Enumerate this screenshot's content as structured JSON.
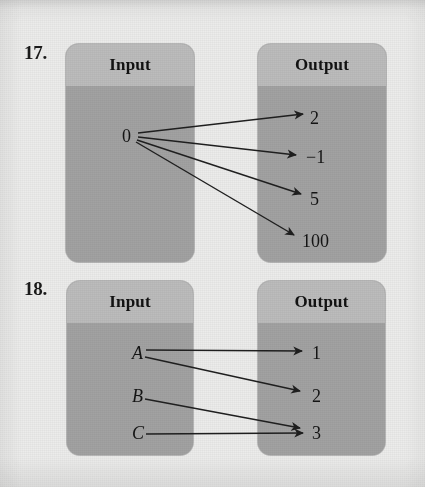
{
  "page": {
    "background_color": "#ececeb",
    "box_header_color": "#bcbcbc",
    "box_body_color": "#a2a2a2",
    "ink_color": "#1a1a1a"
  },
  "problems": [
    {
      "number": "17.",
      "input_box": {
        "title": "Input"
      },
      "output_box": {
        "title": "Output"
      },
      "inputs": [
        {
          "label": "0"
        }
      ],
      "outputs": [
        {
          "label": "2"
        },
        {
          "label": "−1"
        },
        {
          "label": "5"
        },
        {
          "label": "100"
        }
      ],
      "mappings": [
        {
          "from": "0",
          "to": "2"
        },
        {
          "from": "0",
          "to": "−1"
        },
        {
          "from": "0",
          "to": "5"
        },
        {
          "from": "0",
          "to": "100"
        }
      ]
    },
    {
      "number": "18.",
      "input_box": {
        "title": "Input"
      },
      "output_box": {
        "title": "Output"
      },
      "inputs": [
        {
          "label": "A"
        },
        {
          "label": "B"
        },
        {
          "label": "C"
        }
      ],
      "outputs": [
        {
          "label": "1"
        },
        {
          "label": "2"
        },
        {
          "label": "3"
        }
      ],
      "mappings": [
        {
          "from": "A",
          "to": "1"
        },
        {
          "from": "A",
          "to": "2"
        },
        {
          "from": "B",
          "to": "3"
        },
        {
          "from": "C",
          "to": "3"
        }
      ]
    }
  ]
}
